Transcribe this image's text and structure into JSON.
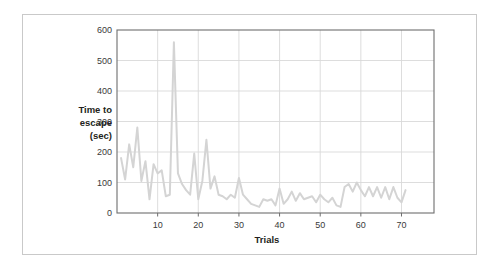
{
  "figure": {
    "frame_color": "#c9c9c9",
    "background": "#ffffff",
    "plot_border_color": "#6e6e6e",
    "gridline_color": "#d9d9d9"
  },
  "labels": {
    "y_axis_line1": "Time to",
    "y_axis_line2": "escape",
    "y_axis_line3": "(sec)",
    "x_axis_title": "Trials"
  },
  "chart_data": {
    "type": "line",
    "title": "",
    "xlabel": "Trials",
    "ylabel": "Time to escape (sec)",
    "xlim": [
      0,
      78
    ],
    "ylim": [
      0,
      600
    ],
    "xticks": [
      10,
      20,
      30,
      40,
      50,
      60,
      70
    ],
    "xtick_labels": [
      "10",
      "20",
      "30",
      "40",
      "50",
      "60",
      "70"
    ],
    "yticks": [
      0,
      100,
      200,
      300,
      400,
      500,
      600
    ],
    "ytick_labels": [
      "0",
      "100",
      "200",
      "300",
      "400",
      "500",
      "600"
    ],
    "grid": "horizontal-and-vertical",
    "legend": "none",
    "line_color": "#d4d4d4",
    "line_width": 2,
    "series": [
      {
        "name": "Time to escape",
        "x": [
          1,
          2,
          3,
          4,
          5,
          6,
          7,
          8,
          9,
          10,
          11,
          12,
          13,
          14,
          15,
          16,
          17,
          18,
          19,
          20,
          21,
          22,
          23,
          24,
          25,
          26,
          27,
          28,
          29,
          30,
          31,
          32,
          33,
          34,
          35,
          36,
          37,
          38,
          39,
          40,
          41,
          42,
          43,
          44,
          45,
          46,
          47,
          48,
          49,
          50,
          51,
          52,
          53,
          54,
          55,
          56,
          57,
          58,
          59,
          60,
          61,
          62,
          63,
          64,
          65,
          66,
          67,
          68,
          69,
          70,
          71
        ],
        "values": [
          180,
          110,
          225,
          150,
          280,
          105,
          170,
          45,
          160,
          130,
          140,
          55,
          60,
          560,
          130,
          95,
          75,
          60,
          195,
          45,
          105,
          240,
          80,
          120,
          60,
          55,
          45,
          60,
          50,
          115,
          60,
          45,
          30,
          25,
          20,
          45,
          40,
          45,
          25,
          80,
          30,
          45,
          70,
          40,
          65,
          45,
          50,
          55,
          35,
          60,
          45,
          35,
          50,
          25,
          20,
          85,
          95,
          70,
          100,
          75,
          55,
          85,
          55,
          85,
          50,
          85,
          45,
          85,
          50,
          35,
          75
        ]
      }
    ]
  }
}
